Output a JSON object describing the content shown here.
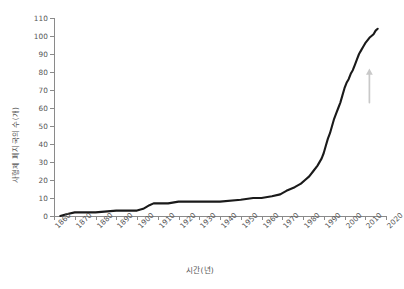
{
  "chart_data": {
    "type": "line",
    "title": "",
    "xlabel": "시간(년)",
    "ylabel": "사형제 폐지국의 수(개)",
    "xlim": [
      1860,
      2020
    ],
    "ylim": [
      0,
      110
    ],
    "grid": false,
    "legend": null,
    "xticks": [
      1860,
      1870,
      1880,
      1890,
      1900,
      1910,
      1920,
      1930,
      1940,
      1950,
      1960,
      1970,
      1980,
      1990,
      2000,
      2010,
      2020
    ],
    "yticks": [
      0,
      10,
      20,
      30,
      40,
      50,
      60,
      70,
      80,
      90,
      100,
      110
    ],
    "xtick_labels": [
      "1860",
      "1870",
      "1880",
      "1890",
      "1900",
      "1910",
      "1920",
      "1930",
      "1940",
      "1950",
      "1960",
      "1970",
      "1980",
      "1990",
      "2000",
      "2010",
      "2020"
    ],
    "ytick_labels": [
      "0",
      "10",
      "20",
      "30",
      "40",
      "50",
      "60",
      "70",
      "80",
      "90",
      "100",
      "110"
    ],
    "series": [
      {
        "name": "사형제 폐지국의 수",
        "color": "#1a1a1a",
        "x": [
          1863,
          1866,
          1870,
          1877,
          1880,
          1890,
          1900,
          1903,
          1906,
          1908,
          1910,
          1915,
          1920,
          1930,
          1940,
          1950,
          1956,
          1960,
          1965,
          1969,
          1972,
          1976,
          1979,
          1981,
          1983,
          1985,
          1987,
          1989,
          1990,
          1991,
          1992,
          1993,
          1994,
          1995,
          1996,
          1997,
          1998,
          1999,
          2000,
          2001,
          2002,
          2003,
          2004,
          2005,
          2006,
          2007,
          2008,
          2009,
          2010,
          2012,
          2014,
          2015,
          2016
        ],
        "y": [
          0,
          1,
          2,
          2,
          2,
          3,
          3,
          4,
          6,
          7,
          7,
          7,
          8,
          8,
          8,
          9,
          10,
          10,
          11,
          12,
          14,
          16,
          18,
          20,
          22,
          25,
          28,
          32,
          35,
          39,
          43,
          46,
          50,
          54,
          57,
          60,
          63,
          67,
          71,
          74,
          76,
          79,
          81,
          84,
          87,
          90,
          92,
          94,
          96,
          99,
          101,
          103,
          104
        ]
      }
    ],
    "annotations": [
      {
        "name": "up-arrow",
        "type": "arrow",
        "direction": "up",
        "color": "#c9c9c9",
        "x": 2012,
        "y_from": 63,
        "y_to": 82
      }
    ]
  }
}
